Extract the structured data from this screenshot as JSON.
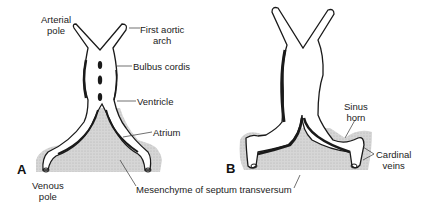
{
  "panels": [
    {
      "id": "A",
      "label": "A"
    },
    {
      "id": "B",
      "label": "B"
    }
  ],
  "labels": {
    "arterial_pole": [
      "Arterial",
      "pole"
    ],
    "first_aortic_arch": [
      "First aortic",
      "arch"
    ],
    "bulbus_cordis": "Bulbus cordis",
    "ventricle": "Ventricle",
    "atrium": "Atrium",
    "venous_pole": [
      "Venous",
      "pole"
    ],
    "mesenchyme": "Mesenchyme of septum transversum",
    "sinus_horn": [
      "Sinus",
      "horn"
    ],
    "cardinal_veins": [
      "Cardinal",
      "veins"
    ]
  },
  "colors": {
    "outline": "#1a1a1a",
    "mesenchyme_fill": "#cfcfcf",
    "background": "#ffffff"
  }
}
